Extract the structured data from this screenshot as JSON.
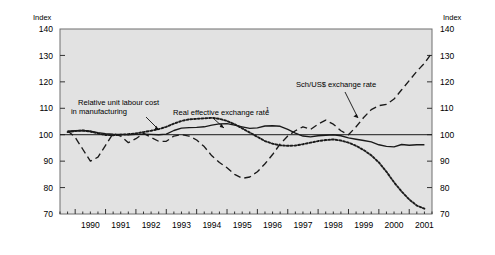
{
  "chart_data": {
    "type": "line",
    "title": "",
    "xlabel": "",
    "ylabel": "Index",
    "ylabel_right": "Index",
    "ylim": [
      70,
      140
    ],
    "yticks": [
      70,
      80,
      90,
      100,
      110,
      120,
      130,
      140
    ],
    "xlim": [
      1989.5,
      2001.75
    ],
    "xticks": [
      1990,
      1991,
      1992,
      1993,
      1994,
      1995,
      1996,
      1997,
      1998,
      1999,
      2000,
      2001
    ],
    "xtick_labels": [
      "1990",
      "1991",
      "1992",
      "1993",
      "1994",
      "1995",
      "1996",
      "1997",
      "1998",
      "1999",
      "2000",
      "2001"
    ],
    "grid": false,
    "legend": "annotations",
    "reference_line": 100,
    "minor_tick_interval_quarters": 1,
    "annotations": [
      {
        "text": "Relative unit labour cost",
        "text2": "in manufacturing",
        "target_series": "Relative unit labour cost in manufacturing"
      },
      {
        "text": "Real effective exchange rate",
        "superscript": "1",
        "target_series": "Real effective exchange rate"
      },
      {
        "text": "Sch/US$ exchange rate",
        "target_series": "Sch/US$ exchange rate"
      }
    ],
    "series": [
      {
        "name": "Real effective exchange rate",
        "style": "solid",
        "color": "#1a1a1a",
        "x": [
          1989.75,
          1990.0,
          1990.25,
          1990.5,
          1990.75,
          1991.0,
          1991.25,
          1991.5,
          1991.75,
          1992.0,
          1992.25,
          1992.5,
          1992.75,
          1993.0,
          1993.25,
          1993.5,
          1993.75,
          1994.0,
          1994.25,
          1994.5,
          1994.75,
          1995.0,
          1995.25,
          1995.5,
          1995.75,
          1996.0,
          1996.25,
          1996.5,
          1996.75,
          1997.0,
          1997.25,
          1997.5,
          1997.75,
          1998.0,
          1998.25,
          1998.5,
          1998.75,
          1999.0,
          1999.25,
          1999.5,
          1999.75,
          2000.0,
          2000.25,
          2000.5,
          2000.75,
          2001.0,
          2001.25,
          2001.5
        ],
        "values": [
          101.3,
          101.5,
          101.6,
          101.3,
          100.8,
          100.4,
          100.2,
          100.1,
          100.0,
          100.1,
          100.2,
          100.1,
          100.0,
          100.2,
          101.6,
          102.5,
          102.7,
          102.8,
          103.0,
          103.6,
          104.1,
          104.2,
          103.6,
          103.0,
          102.4,
          102.6,
          103.3,
          103.4,
          103.2,
          102.0,
          100.6,
          99.5,
          99.2,
          99.6,
          99.8,
          100.0,
          99.6,
          98.8,
          98.3,
          97.8,
          97.3,
          96.2,
          95.6,
          95.4,
          96.3,
          96.0,
          96.2,
          96.2
        ]
      },
      {
        "name": "Relative unit labour cost in manufacturing",
        "style": "dotted",
        "color": "#1a1a1a",
        "x": [
          1989.75,
          1990.0,
          1990.25,
          1990.5,
          1990.75,
          1991.0,
          1991.25,
          1991.5,
          1991.75,
          1992.0,
          1992.25,
          1992.5,
          1992.75,
          1993.0,
          1993.25,
          1993.5,
          1993.75,
          1994.0,
          1994.25,
          1994.5,
          1994.75,
          1995.0,
          1995.25,
          1995.5,
          1995.75,
          1996.0,
          1996.25,
          1996.5,
          1996.75,
          1997.0,
          1997.25,
          1997.5,
          1997.75,
          1998.0,
          1998.25,
          1998.5,
          1998.75,
          1999.0,
          1999.25,
          1999.5,
          1999.75,
          2000.0,
          2000.25,
          2000.5,
          2000.75,
          2001.0,
          2001.25,
          2001.5
        ],
        "values": [
          101.0,
          101.4,
          101.6,
          101.2,
          100.5,
          99.9,
          99.8,
          100.0,
          100.2,
          100.5,
          101.0,
          101.5,
          102.1,
          103.0,
          104.2,
          105.2,
          105.8,
          106.0,
          106.2,
          106.4,
          106.0,
          105.2,
          104.0,
          102.4,
          100.8,
          99.2,
          97.6,
          96.6,
          96.0,
          95.8,
          95.9,
          96.4,
          97.0,
          97.6,
          98.0,
          98.2,
          97.8,
          97.0,
          95.8,
          94.2,
          92.2,
          89.5,
          86.0,
          82.0,
          78.5,
          75.5,
          73.2,
          72.0
        ]
      },
      {
        "name": "Sch/US$ exchange rate",
        "style": "dashed",
        "color": "#1a1a1a",
        "x": [
          1989.75,
          1990.0,
          1990.25,
          1990.5,
          1990.75,
          1991.0,
          1991.25,
          1991.5,
          1991.75,
          1992.0,
          1992.25,
          1992.5,
          1992.75,
          1993.0,
          1993.25,
          1993.5,
          1993.75,
          1994.0,
          1994.25,
          1994.5,
          1994.75,
          1995.0,
          1995.25,
          1995.5,
          1995.75,
          1996.0,
          1996.25,
          1996.5,
          1996.75,
          1997.0,
          1997.25,
          1997.5,
          1997.75,
          1998.0,
          1998.25,
          1998.5,
          1998.75,
          1999.0,
          1999.25,
          1999.5,
          1999.75,
          2000.0,
          2000.25,
          2000.5,
          2000.75,
          2001.0,
          2001.25,
          2001.5
        ],
        "values": [
          101.5,
          99.0,
          94.5,
          90.0,
          91.5,
          96.0,
          100.5,
          99.5,
          97.0,
          98.5,
          100.5,
          99.0,
          97.5,
          97.5,
          99.5,
          100.0,
          99.5,
          98.0,
          95.5,
          92.0,
          89.5,
          87.5,
          85.0,
          83.5,
          84.0,
          86.0,
          89.0,
          92.5,
          96.5,
          99.5,
          101.5,
          103.0,
          102.0,
          104.0,
          105.5,
          104.0,
          101.5,
          100.0,
          103.0,
          106.5,
          109.5,
          111.0,
          111.5,
          113.5,
          117.0,
          120.5,
          124.0,
          127.0
        ]
      }
    ],
    "series_extra_tail": {
      "Sch/US$ exchange rate": {
        "x": [
          2001.5,
          2001.75,
          2002.0,
          2002.25
        ],
        "values": [
          127.0,
          131.0,
          136.0,
          132.5
        ]
      }
    }
  },
  "figure": {
    "background": "#ffffff",
    "plot_background": "#e2e2e2",
    "plot_border_color": "#6e6e6e",
    "axis_text_color": "#000000"
  }
}
